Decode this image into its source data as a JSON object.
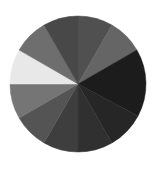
{
  "wheel": {
    "center": [
      78,
      84
    ],
    "radius": 68,
    "segments": [
      {
        "start": 0,
        "end": 30,
        "color": "#505050"
      },
      {
        "start": 30,
        "end": 60,
        "color": "#656565"
      },
      {
        "start": 60,
        "end": 118,
        "color": "#1c1c1c"
      },
      {
        "start": 118,
        "end": 150,
        "color": "#262626"
      },
      {
        "start": 150,
        "end": 180,
        "color": "#303030"
      },
      {
        "start": 180,
        "end": 210,
        "color": "#3e3e3e"
      },
      {
        "start": 210,
        "end": 240,
        "color": "#545454"
      },
      {
        "start": 240,
        "end": 270,
        "color": "#757575"
      },
      {
        "start": 270,
        "end": 300,
        "color": "#e8e8e8"
      },
      {
        "start": 300,
        "end": 330,
        "color": "#6e6e6e"
      },
      {
        "start": 330,
        "end": 360,
        "color": "#484848"
      }
    ]
  }
}
